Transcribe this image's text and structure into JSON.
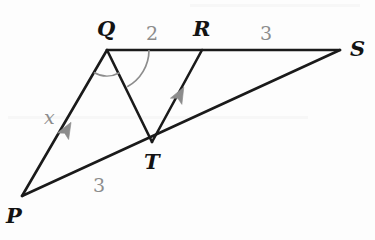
{
  "figure": {
    "background_color": "#fdfdfd",
    "stroke_color": "#1a1a1a",
    "accent_color": "#8c8c8c",
    "width": 375,
    "height": 240,
    "points": {
      "P": {
        "x": 22,
        "y": 196
      },
      "Q": {
        "x": 107,
        "y": 50
      },
      "R": {
        "x": 202,
        "y": 50
      },
      "S": {
        "x": 340,
        "y": 50
      },
      "T": {
        "x": 152,
        "y": 142
      }
    },
    "vertex_labels": [
      {
        "name": "P",
        "text": "P",
        "x": 6,
        "y": 205
      },
      {
        "name": "Q",
        "text": "Q",
        "x": 97,
        "y": 18
      },
      {
        "name": "R",
        "text": "R",
        "x": 193,
        "y": 18
      },
      {
        "name": "S",
        "text": "S",
        "x": 350,
        "y": 38
      },
      {
        "name": "T",
        "text": "T",
        "x": 144,
        "y": 151
      }
    ],
    "segments": [
      {
        "name": "segment-PS",
        "from": "P",
        "to": "S"
      },
      {
        "name": "segment-QS",
        "from": "Q",
        "to": "S"
      },
      {
        "name": "segment-PQ",
        "from": "P",
        "to": "Q"
      },
      {
        "name": "segment-QT",
        "from": "Q",
        "to": "T"
      },
      {
        "name": "segment-TR",
        "from": "T",
        "to": "R"
      }
    ],
    "measure_labels": [
      {
        "name": "x-on-PQ",
        "text": "x",
        "x": 44,
        "y": 108,
        "italic": true
      },
      {
        "name": "3-on-PT",
        "text": "3",
        "x": 93,
        "y": 176,
        "italic": false
      },
      {
        "name": "2-on-QR",
        "text": "2",
        "x": 146,
        "y": 24,
        "italic": false
      },
      {
        "name": "3-on-RS",
        "text": "3",
        "x": 260,
        "y": 24,
        "italic": false
      }
    ],
    "parallel_arrows": [
      {
        "name": "arrow-on-PQ",
        "x": 66,
        "y": 131,
        "angle": -59.8
      },
      {
        "name": "arrow-on-TR",
        "x": 179,
        "y": 96,
        "angle": -61.5
      }
    ],
    "angle_arcs": [
      {
        "name": "angle-PQT-arc",
        "radius": 26,
        "start_deg": 120.2,
        "end_deg": 61.2
      },
      {
        "name": "angle-TQR-arc",
        "radius": 42,
        "start_deg": 61.2,
        "end_deg": 0
      }
    ]
  }
}
